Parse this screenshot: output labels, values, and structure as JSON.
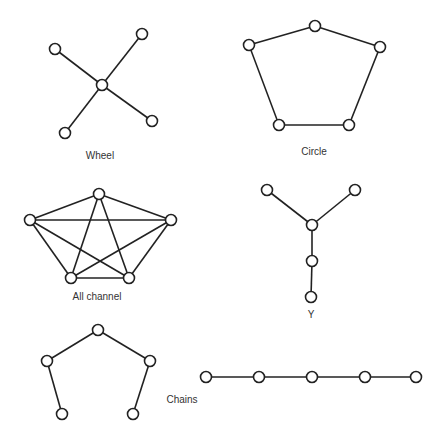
{
  "diagram": {
    "colors": {
      "stroke": "#222222",
      "node_fill": "#ffffff",
      "text": "#333333"
    },
    "networks": [
      {
        "id": "wheel",
        "label": "Wheel",
        "label_pos": [
          100,
          159
        ],
        "nodes": [
          [
            55,
            49
          ],
          [
            142,
            34
          ],
          [
            102,
            85
          ],
          [
            152,
            121
          ],
          [
            65,
            133
          ]
        ],
        "edges": [
          [
            0,
            2
          ],
          [
            1,
            2
          ],
          [
            2,
            3
          ],
          [
            2,
            4
          ]
        ]
      },
      {
        "id": "circle",
        "label": "Circle",
        "label_pos": [
          314,
          155
        ],
        "nodes": [
          [
            249,
            45
          ],
          [
            315,
            26
          ],
          [
            380,
            47
          ],
          [
            279,
            125
          ],
          [
            349,
            125
          ]
        ],
        "edges": [
          [
            0,
            1
          ],
          [
            1,
            2
          ],
          [
            2,
            4
          ],
          [
            4,
            3
          ],
          [
            3,
            0
          ]
        ]
      },
      {
        "id": "all-channel",
        "label": "All channel",
        "label_pos": [
          97,
          300
        ],
        "nodes": [
          [
            30,
            220
          ],
          [
            99,
            194
          ],
          [
            171,
            220
          ],
          [
            71,
            278
          ],
          [
            129,
            278
          ]
        ],
        "edges": [
          [
            0,
            1
          ],
          [
            0,
            2
          ],
          [
            0,
            3
          ],
          [
            0,
            4
          ],
          [
            1,
            2
          ],
          [
            1,
            3
          ],
          [
            1,
            4
          ],
          [
            2,
            3
          ],
          [
            2,
            4
          ],
          [
            3,
            4
          ]
        ]
      },
      {
        "id": "y",
        "label": "Y",
        "label_pos": [
          311,
          318
        ],
        "nodes": [
          [
            267,
            190
          ],
          [
            355,
            190
          ],
          [
            312,
            225
          ],
          [
            312,
            261
          ],
          [
            311,
            297
          ]
        ],
        "edges": [
          [
            0,
            2
          ],
          [
            1,
            2
          ],
          [
            2,
            3
          ],
          [
            3,
            4
          ]
        ]
      },
      {
        "id": "chain-bent",
        "label": "",
        "label_pos": [
          0,
          0
        ],
        "nodes": [
          [
            98,
            330
          ],
          [
            47,
            361
          ],
          [
            150,
            361
          ],
          [
            62,
            414
          ],
          [
            133,
            414
          ]
        ],
        "edges": [
          [
            0,
            1
          ],
          [
            0,
            2
          ],
          [
            1,
            3
          ],
          [
            2,
            4
          ]
        ]
      },
      {
        "id": "chain-straight",
        "label": "",
        "label_pos": [
          0,
          0
        ],
        "nodes": [
          [
            206,
            377
          ],
          [
            259,
            377
          ],
          [
            312,
            377
          ],
          [
            365,
            377
          ],
          [
            416,
            377
          ]
        ],
        "edges": [
          [
            0,
            1
          ],
          [
            1,
            2
          ],
          [
            2,
            3
          ],
          [
            3,
            4
          ]
        ]
      }
    ],
    "chains_label": {
      "text": "Chains",
      "pos": [
        182,
        403
      ]
    },
    "node_radius": 5.5
  }
}
